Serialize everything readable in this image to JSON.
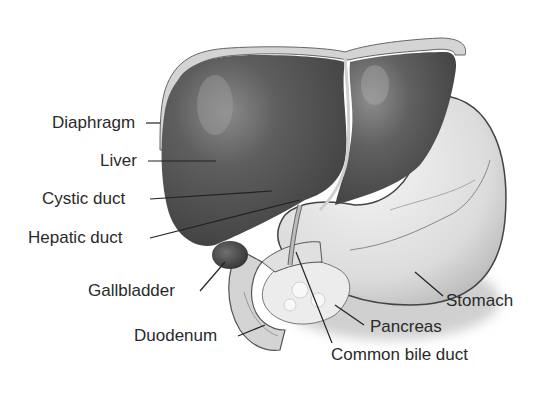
{
  "diagram": {
    "colors": {
      "liver": "#5a5a5a",
      "liver_highlight": "#9a9a9a",
      "diaphragm": "#c8c8c8",
      "stomach": "#e2e2e2",
      "pancreas": "#ececec",
      "duodenum": "#d6d6d6",
      "gallbladder": "#4a4a4a",
      "leader_line": "#222222",
      "text": "#2a2a2a"
    },
    "labels": [
      {
        "id": "diaphragm",
        "text": "Diaphragm"
      },
      {
        "id": "liver",
        "text": "Liver"
      },
      {
        "id": "cystic_duct",
        "text": "Cystic duct"
      },
      {
        "id": "hepatic_duct",
        "text": "Hepatic duct"
      },
      {
        "id": "gallbladder",
        "text": "Gallbladder"
      },
      {
        "id": "duodenum",
        "text": "Duodenum"
      },
      {
        "id": "stomach",
        "text": "Stomach"
      },
      {
        "id": "pancreas",
        "text": "Pancreas"
      },
      {
        "id": "common_bile_duct",
        "text": "Common bile duct"
      }
    ]
  }
}
